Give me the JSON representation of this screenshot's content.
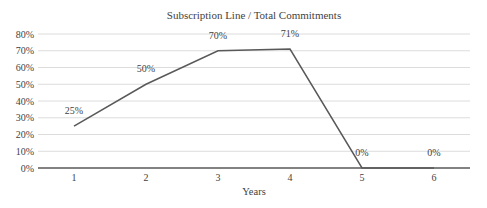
{
  "chart_data": {
    "type": "line",
    "title": "Subscription Line / Total Commitments",
    "xlabel": "Years",
    "categories": [
      "1",
      "2",
      "3",
      "4",
      "5",
      "6"
    ],
    "values": [
      25,
      50,
      70,
      71,
      0,
      0
    ],
    "data_labels": [
      "25%",
      "50%",
      "70%",
      "71%",
      "0%",
      "0%"
    ],
    "ylim": [
      0,
      80
    ],
    "ytick_step": 10,
    "ytick_labels": [
      "0%",
      "10%",
      "20%",
      "30%",
      "40%",
      "50%",
      "60%",
      "70%",
      "80%"
    ],
    "grid": true,
    "legend_position": "none",
    "colors": {
      "series_line": "#595959",
      "axis_line": "#595959",
      "gridline": "#dcdcdc",
      "text": "#3f3f3f"
    }
  }
}
